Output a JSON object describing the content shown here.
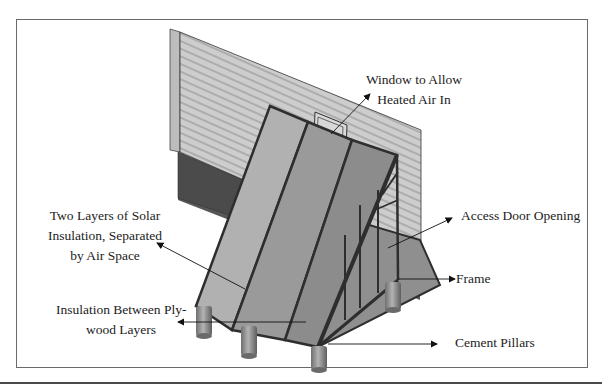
{
  "diagram": {
    "labels": {
      "window": {
        "line1": "Window to Allow",
        "line2": "Heated Air In"
      },
      "solar_insulation": {
        "line1": "Two Layers of Solar",
        "line2": "Insulation, Separated",
        "line3": "by Air Space"
      },
      "access_door": {
        "text": "Access Door Opening"
      },
      "frame": {
        "text": "Frame"
      },
      "plywood_insulation": {
        "line1": "Insulation Between Ply-",
        "line2": "wood Layers"
      },
      "pillars": {
        "text": "Cement Pillars"
      }
    },
    "colors": {
      "siding": "#c9c9c9",
      "siding_lines": "#8c8c8c",
      "dark_wall": "#555555",
      "glazing": "#a9a9a9",
      "frame_members": "#2e2e2e",
      "pillar": "#8a8a8a",
      "border": "#6a6a6a"
    }
  }
}
